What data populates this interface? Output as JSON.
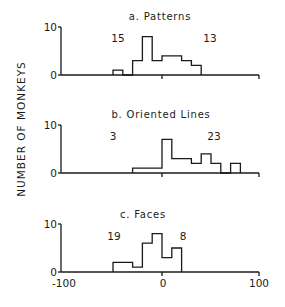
{
  "figure": {
    "ylabel": "NUMBER OF MONKEYS",
    "xlabel": "",
    "x_ticks": [
      "-100",
      "0",
      "100"
    ]
  },
  "chart_data": [
    {
      "type": "bar",
      "title": "a. Patterns",
      "xlabel": "",
      "ylabel": "NUMBER OF MONKEYS",
      "xlim": [
        -100,
        100
      ],
      "ylim": [
        0,
        10
      ],
      "y_ticks": [
        0,
        10
      ],
      "bin_edges": [
        -50,
        -40,
        -30,
        -20,
        -10,
        0,
        10,
        20,
        30,
        40
      ],
      "bins": [
        {
          "from": -50,
          "to": -40,
          "count": 1
        },
        {
          "from": -40,
          "to": -30,
          "count": 0
        },
        {
          "from": -30,
          "to": -20,
          "count": 3
        },
        {
          "from": -20,
          "to": -10,
          "count": 8
        },
        {
          "from": -10,
          "to": 0,
          "count": 3
        },
        {
          "from": 0,
          "to": 10,
          "count": 4
        },
        {
          "from": 10,
          "to": 20,
          "count": 4
        },
        {
          "from": 20,
          "to": 30,
          "count": 3
        },
        {
          "from": 30,
          "to": 40,
          "count": 2
        }
      ],
      "annotations": {
        "left_count": "15",
        "right_count": "13"
      }
    },
    {
      "type": "bar",
      "title": "b. Oriented Lines",
      "xlabel": "",
      "ylabel": "NUMBER OF MONKEYS",
      "xlim": [
        -100,
        100
      ],
      "ylim": [
        0,
        10
      ],
      "y_ticks": [
        0,
        10
      ],
      "bins": [
        {
          "from": -30,
          "to": -20,
          "count": 1
        },
        {
          "from": -20,
          "to": -10,
          "count": 1
        },
        {
          "from": -10,
          "to": 0,
          "count": 1
        },
        {
          "from": 0,
          "to": 10,
          "count": 7
        },
        {
          "from": 10,
          "to": 20,
          "count": 3
        },
        {
          "from": 20,
          "to": 30,
          "count": 3
        },
        {
          "from": 30,
          "to": 40,
          "count": 2
        },
        {
          "from": 40,
          "to": 50,
          "count": 4
        },
        {
          "from": 50,
          "to": 60,
          "count": 2
        },
        {
          "from": 60,
          "to": 70,
          "count": 0
        },
        {
          "from": 70,
          "to": 80,
          "count": 2
        }
      ],
      "annotations": {
        "left_count": "3",
        "right_count": "23"
      }
    },
    {
      "type": "bar",
      "title": "c. Faces",
      "xlabel": "",
      "ylabel": "NUMBER OF MONKEYS",
      "xlim": [
        -100,
        100
      ],
      "ylim": [
        0,
        10
      ],
      "y_ticks": [
        0,
        10
      ],
      "x_ticks": [
        -100,
        0,
        100
      ],
      "bins": [
        {
          "from": -50,
          "to": -40,
          "count": 2
        },
        {
          "from": -40,
          "to": -30,
          "count": 2
        },
        {
          "from": -30,
          "to": -20,
          "count": 1
        },
        {
          "from": -20,
          "to": -10,
          "count": 6
        },
        {
          "from": -10,
          "to": 0,
          "count": 8
        },
        {
          "from": 0,
          "to": 10,
          "count": 3
        },
        {
          "from": 10,
          "to": 20,
          "count": 5
        }
      ],
      "annotations": {
        "left_count": "19",
        "right_count": "8"
      }
    }
  ],
  "layout": {
    "x_px_per_unit": 0.98,
    "x_zero_px": 162,
    "axis_left_px": 61,
    "axis_right_px": 259,
    "y_px_per_unit": 4.8,
    "panels": [
      {
        "baseline_px": 75,
        "title_y": 20,
        "title_x": 160,
        "left_label_x": 118,
        "right_label_x": 210,
        "label_y": 42
      },
      {
        "baseline_px": 173,
        "title_y": 118,
        "title_x": 161,
        "left_label_x": 113,
        "right_label_x": 214,
        "label_y": 140
      },
      {
        "baseline_px": 272,
        "title_y": 218,
        "title_x": 143,
        "left_label_x": 114,
        "right_label_x": 183,
        "label_y": 240
      }
    ]
  }
}
